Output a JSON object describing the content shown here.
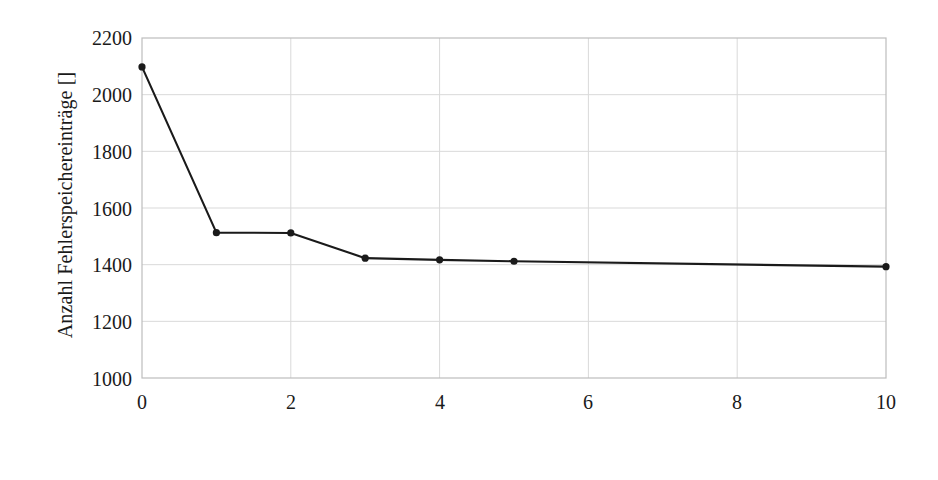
{
  "chart_data": {
    "type": "line",
    "title": "",
    "xlabel": "Zähler c []",
    "ylabel": "Anzahl Fehlerspeichereinträge []",
    "xlim": [
      0,
      10
    ],
    "ylim": [
      1000,
      2200
    ],
    "xticks": [
      "0",
      "2",
      "4",
      "6",
      "8",
      "10"
    ],
    "xtick_values": [
      0,
      2,
      4,
      6,
      8,
      10
    ],
    "yticks": [
      "1000",
      "1200",
      "1400",
      "1600",
      "1800",
      "2000",
      "2200"
    ],
    "ytick_values": [
      1000,
      1200,
      1400,
      1600,
      1800,
      2000,
      2200
    ],
    "grid": true,
    "legend": null,
    "series": [
      {
        "name": "Anzahl Fehlerspeichereinträge",
        "marker": "filled-circle",
        "color": "#1a1a1a",
        "x": [
          0,
          1,
          2,
          3,
          4,
          5,
          10
        ],
        "y": [
          2098,
          1513,
          1512,
          1423,
          1417,
          1412,
          1393
        ]
      }
    ]
  },
  "style": {
    "line_color": "#1a1a1a",
    "marker_color": "#1a1a1a",
    "grid_color": "#d9d9d9",
    "axis_color": "#bdbdbd",
    "background": "#ffffff"
  }
}
